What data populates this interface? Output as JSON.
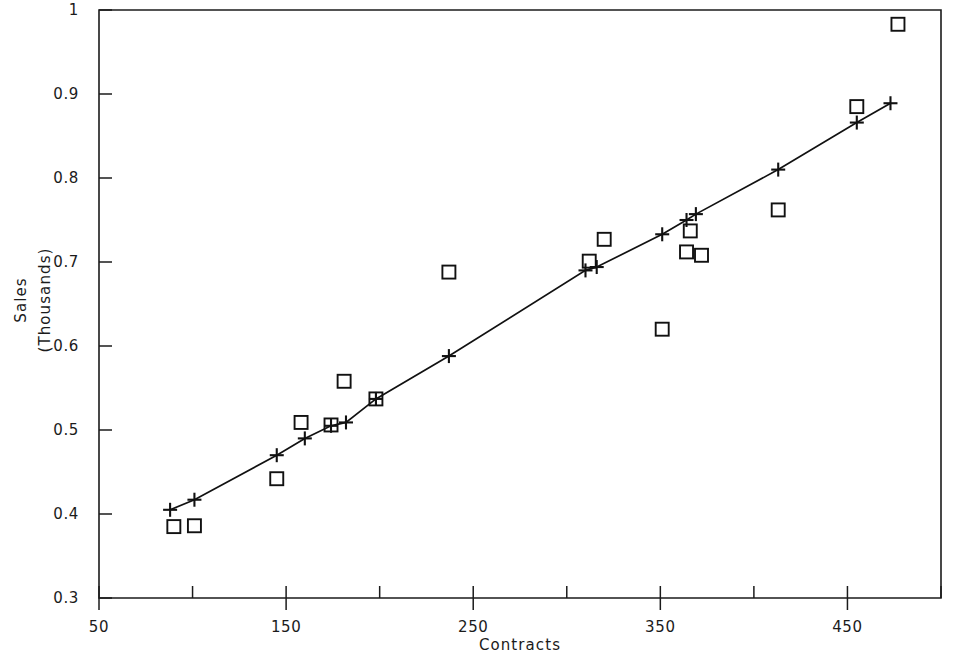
{
  "chart_data": {
    "type": "scatter",
    "title": "",
    "xlabel": "Contracts",
    "ylabel": "Sales\n(Thousands)",
    "ylabel_line1": "Sales",
    "ylabel_line2": "(Thousands)",
    "xlim": [
      50,
      500
    ],
    "ylim": [
      0.3,
      1.0
    ],
    "grid": false,
    "legend": "none",
    "x_major_ticks": [
      50,
      150,
      250,
      350,
      450
    ],
    "x_major_tick_labels": [
      "50",
      "150",
      "250",
      "350",
      "450"
    ],
    "x_minor_ticks": [
      100,
      200,
      300,
      400,
      500
    ],
    "y_ticks": [
      0.3,
      0.4,
      0.5,
      0.6,
      0.7,
      0.8,
      0.9,
      1
    ],
    "y_tick_labels": [
      "0.3",
      "0.4",
      "0.5",
      "0.6",
      "0.7",
      "0.8",
      "0.9",
      "1"
    ],
    "series": [
      {
        "name": "Observed",
        "marker": "open-square",
        "color": "#111111",
        "points": [
          {
            "x": 90,
            "y": 0.385
          },
          {
            "x": 101,
            "y": 0.386
          },
          {
            "x": 145,
            "y": 0.442
          },
          {
            "x": 158,
            "y": 0.509
          },
          {
            "x": 174,
            "y": 0.506
          },
          {
            "x": 181,
            "y": 0.558
          },
          {
            "x": 198,
            "y": 0.537
          },
          {
            "x": 237,
            "y": 0.688
          },
          {
            "x": 312,
            "y": 0.701
          },
          {
            "x": 320,
            "y": 0.727
          },
          {
            "x": 351,
            "y": 0.62
          },
          {
            "x": 364,
            "y": 0.712
          },
          {
            "x": 366,
            "y": 0.737
          },
          {
            "x": 372,
            "y": 0.708
          },
          {
            "x": 413,
            "y": 0.762
          },
          {
            "x": 455,
            "y": 0.885
          },
          {
            "x": 477,
            "y": 0.983
          }
        ]
      },
      {
        "name": "Fitted",
        "marker": "plus",
        "color": "#111111",
        "line": true,
        "points": [
          {
            "x": 88,
            "y": 0.405
          },
          {
            "x": 101,
            "y": 0.417
          },
          {
            "x": 145,
            "y": 0.47
          },
          {
            "x": 160,
            "y": 0.49
          },
          {
            "x": 174,
            "y": 0.505
          },
          {
            "x": 182,
            "y": 0.509
          },
          {
            "x": 198,
            "y": 0.537
          },
          {
            "x": 237,
            "y": 0.588
          },
          {
            "x": 310,
            "y": 0.69
          },
          {
            "x": 316,
            "y": 0.694
          },
          {
            "x": 351,
            "y": 0.733
          },
          {
            "x": 364,
            "y": 0.75
          },
          {
            "x": 369,
            "y": 0.757
          },
          {
            "x": 413,
            "y": 0.81
          },
          {
            "x": 455,
            "y": 0.866
          },
          {
            "x": 473,
            "y": 0.889
          }
        ]
      }
    ]
  },
  "axes": {
    "x_axis_name": "Contracts",
    "y_axis_name": "Sales (Thousands)"
  },
  "colors": {
    "ink": "#111111",
    "background": "#ffffff"
  }
}
